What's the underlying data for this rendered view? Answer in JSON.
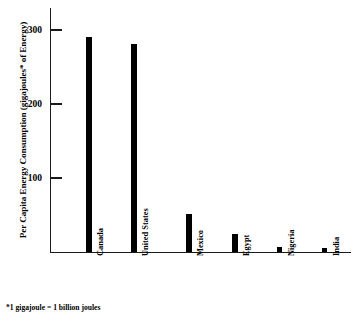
{
  "chart_data": {
    "type": "bar",
    "title": "",
    "xlabel": "",
    "ylabel": "Per Capita Energy Consumption (gigajoules* of Energy)",
    "categories": [
      "Canada",
      "United States",
      "Mexico",
      "Egypt",
      "Nigeria",
      "India"
    ],
    "values": [
      291,
      281,
      51,
      24,
      7,
      6
    ],
    "ylim": [
      0,
      330
    ],
    "yticks": [
      100,
      200,
      300
    ],
    "ytick_labels": [
      "100",
      "200",
      "300"
    ],
    "grid": false,
    "legend": null,
    "bar_color": "#000000",
    "axis_color": "#1a1a1a",
    "annotations": [
      "*1 gigajoule = 1 billion joules"
    ]
  },
  "footnote": "*1 gigajoule = 1 billion joules"
}
